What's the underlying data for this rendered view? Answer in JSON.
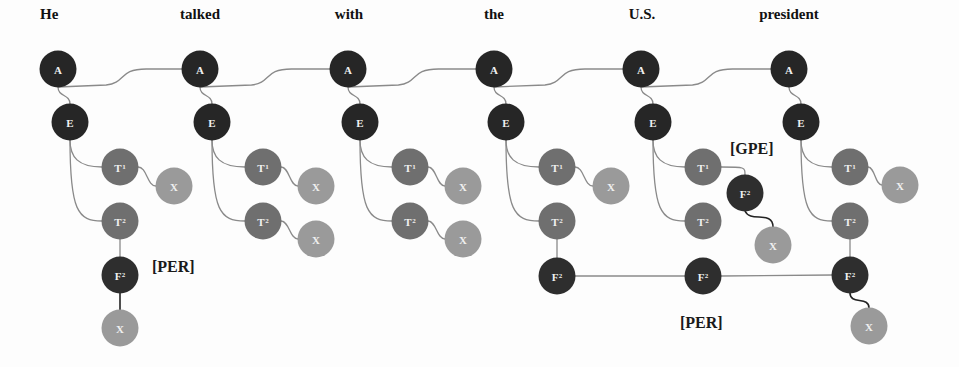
{
  "diagram": {
    "colors": {
      "A": "#262626",
      "E": "#262626",
      "T": "#6f6f6f",
      "F": "#2e2e2e",
      "X": "#9a9a9a",
      "edge": "#8a8a8a",
      "edge_dark": "#222222"
    },
    "words": [
      {
        "text": "He",
        "x": 40,
        "y": 6
      },
      {
        "text": "talked",
        "x": 200,
        "y": 6
      },
      {
        "text": "with",
        "x": 349,
        "y": 6
      },
      {
        "text": "the",
        "x": 494,
        "y": 6
      },
      {
        "text": "U.S.",
        "x": 642,
        "y": 6
      },
      {
        "text": "president",
        "x": 789,
        "y": 6
      }
    ],
    "node_labels": {
      "A": "A",
      "E": "E",
      "T": "T",
      "F": "F",
      "X": "X",
      "sup1": "1",
      "sup2": "2"
    },
    "tags": [
      {
        "text": "[PER]",
        "x": 152,
        "y": 258
      },
      {
        "text": "[GPE]",
        "x": 730,
        "y": 140
      },
      {
        "text": "[PER]",
        "x": 680,
        "y": 314
      }
    ],
    "columns": [
      {
        "word": "He",
        "A": [
          58,
          69
        ],
        "E": [
          70,
          122
        ],
        "T1": [
          120,
          167
        ],
        "T2": [
          120,
          221
        ],
        "X1": [
          174,
          186
        ],
        "F2": [
          120,
          275
        ],
        "X_F": [
          120,
          328
        ]
      },
      {
        "word": "talked",
        "A": [
          200,
          69
        ],
        "E": [
          212,
          122
        ],
        "T1": [
          263,
          167
        ],
        "T2": [
          263,
          221
        ],
        "X1": [
          316,
          186
        ],
        "X2": [
          316,
          239
        ]
      },
      {
        "word": "with",
        "A": [
          348,
          69
        ],
        "E": [
          360,
          122
        ],
        "T1": [
          410,
          167
        ],
        "T2": [
          410,
          221
        ],
        "X1": [
          463,
          186
        ],
        "X2": [
          463,
          239
        ]
      },
      {
        "word": "the",
        "A": [
          494,
          69
        ],
        "E": [
          506,
          122
        ],
        "T1": [
          557,
          167
        ],
        "T2": [
          557,
          221
        ],
        "X1": [
          611,
          186
        ],
        "F2": [
          557,
          276
        ]
      },
      {
        "word": "U.S.",
        "A": [
          641,
          69
        ],
        "E": [
          653,
          122
        ],
        "T1": [
          703,
          167
        ],
        "T2": [
          703,
          221
        ],
        "F2_gpe": [
          745,
          193
        ],
        "X_gpe": [
          773,
          245
        ],
        "F2": [
          703,
          276
        ]
      },
      {
        "word": "president",
        "A": [
          789,
          69
        ],
        "E": [
          801,
          122
        ],
        "T1": [
          850,
          167
        ],
        "T2": [
          850,
          221
        ],
        "X1": [
          900,
          185
        ],
        "F2": [
          850,
          275
        ],
        "X_F": [
          869,
          326
        ]
      }
    ]
  }
}
